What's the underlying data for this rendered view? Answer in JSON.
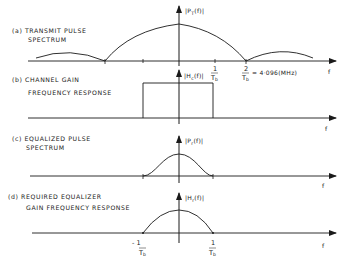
{
  "figure": {
    "axis_variable": "f",
    "panels": [
      {
        "id": "a",
        "caption_line1": "(a) TRANSMIT PULSE",
        "caption_line2": "SPECTRUM",
        "y_label_main": "|P",
        "y_label_sub": "T",
        "y_label_tail": "(f)|",
        "x_label": "f",
        "annotations": {
          "tick_1_num": "1",
          "tick_1_den": "T",
          "tick_1_den_sub": "b",
          "tick_2_num": "2",
          "tick_2_den": "T",
          "tick_2_den_sub": "b",
          "tick_2_value": "= 4·096(MHz)"
        },
        "shape": "sinc-magnitude"
      },
      {
        "id": "b",
        "caption_line1": "(b) CHANNEL GAIN",
        "caption_line2": "FREQUENCY RESPONSE",
        "y_label_main": "|H",
        "y_label_sub": "c",
        "y_label_tail": "(f)|",
        "x_label": "f",
        "shape": "rectangular, from -1/Tb to +1/Tb"
      },
      {
        "id": "c",
        "caption_line1": "(c) EQUALIZED PULSE",
        "caption_line2": "SPECTRUM",
        "y_label_main": "|P",
        "y_label_sub": "r",
        "y_label_tail": "(f)|",
        "x_label": "f",
        "shape": "raised-cosine, from -1/Tb to +1/Tb"
      },
      {
        "id": "d",
        "caption_line1": "(d) REQUIRED EQUALIZER",
        "caption_line2": "GAIN FREQUENCY RESPONSE",
        "y_label_main": "|H",
        "y_label_sub": "r",
        "y_label_tail": "(f)|",
        "x_label": "f",
        "annotations": {
          "neg_tick": "- 1",
          "neg_tick_den": "T",
          "neg_tick_den_sub": "b",
          "pos_tick": "1",
          "pos_tick_den": "T",
          "pos_tick_den_sub": "b"
        },
        "shape": "parabolic dome, from -1/Tb to +1/Tb"
      }
    ],
    "colors": {
      "ink": "#1a1a1a",
      "background": "#ffffff"
    }
  }
}
